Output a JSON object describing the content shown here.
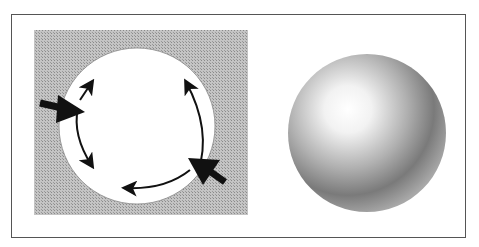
{
  "figure": {
    "left_panel": {
      "description": "White circle on hatched gray square with arrows indicating forces/light around edge",
      "background_color": "#b8b8b8"
    },
    "right_panel": {
      "description": "Shaded sphere with highlight at upper-left",
      "highlight_color": "#ffffff",
      "shadow_color": "#6a6a6a"
    }
  }
}
